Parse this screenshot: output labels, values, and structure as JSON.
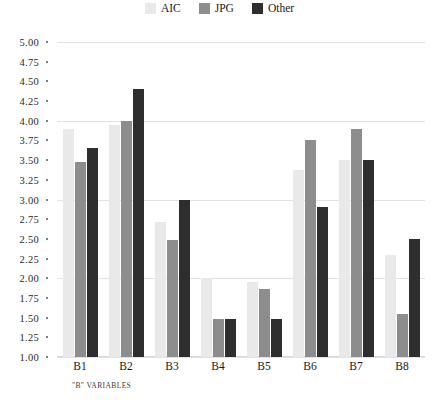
{
  "chart_data": {
    "type": "bar",
    "title": "",
    "xlabel": "\"B\" VARIABLES",
    "ylabel": "",
    "ylim": [
      1.0,
      5.0
    ],
    "ytick_step": 0.25,
    "ytick_labels": [
      "5.00",
      "4.75",
      "4.50",
      "4.25",
      "4.00",
      "3.75",
      "3.50",
      "3.25",
      "3.00",
      "2.75",
      "2.50",
      "2.25",
      "2.00",
      "1.75",
      "1.50",
      "1.25",
      "1.00"
    ],
    "grid": true,
    "gridlines_at": [
      5.0,
      4.0,
      3.0,
      2.0,
      1.0
    ],
    "legend_position": "top-center",
    "categories": [
      "B1",
      "B2",
      "B3",
      "B4",
      "B5",
      "B6",
      "B7",
      "B8"
    ],
    "series": [
      {
        "name": "AIC",
        "color": "#e9e9e9",
        "values": [
          3.9,
          3.95,
          2.72,
          2.0,
          1.95,
          3.37,
          3.5,
          2.3
        ]
      },
      {
        "name": "JPG",
        "color": "#8d8d8d",
        "values": [
          3.48,
          4.0,
          2.48,
          1.48,
          1.87,
          3.75,
          3.9,
          1.55
        ]
      },
      {
        "name": "Other",
        "color": "#2e2e2e",
        "values": [
          3.65,
          4.4,
          3.0,
          1.48,
          1.48,
          2.9,
          3.5,
          2.5
        ]
      }
    ]
  },
  "legend": {
    "items": [
      {
        "label": "AIC",
        "color": "#e9e9e9"
      },
      {
        "label": "JPG",
        "color": "#8d8d8d"
      },
      {
        "label": "Other",
        "color": "#2e2e2e"
      }
    ]
  },
  "axis": {
    "x_title": "\"B\" VARIABLES"
  }
}
